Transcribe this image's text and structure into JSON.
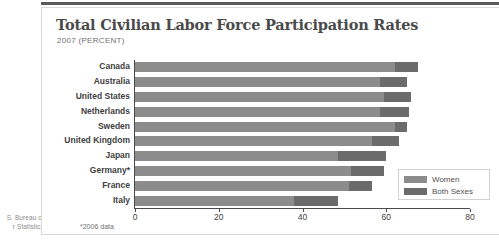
{
  "page": {
    "source_margin_line1": "S. Bureau of",
    "source_margin_line2": "r Statistics"
  },
  "panel": {
    "title": "Total Civilian Labor Force Participation Rates",
    "subtitle": "2007 (PERCENT)",
    "footnote": "*2006 data"
  },
  "legend": {
    "position": "inside-bottom-right",
    "items": [
      {
        "label": "Women",
        "color": "#8c8c8c"
      },
      {
        "label": "Both Sexes",
        "color": "#6b6b6b"
      }
    ]
  },
  "colors": {
    "women": "#8c8c8c",
    "both_sexes": "#6b6b6b",
    "axis": "#4a4a4a",
    "title": "#4a4a4a",
    "panel_border": "#d9d9d9"
  },
  "chart_data": {
    "type": "bar",
    "orientation": "horizontal",
    "title": "Total Civilian Labor Force Participation Rates",
    "subtitle": "2007 (PERCENT)",
    "xlabel": "",
    "ylabel": "",
    "xlim": [
      0,
      80
    ],
    "xticks": [
      0,
      20,
      40,
      60,
      80
    ],
    "grid": false,
    "legend": [
      "Women",
      "Both Sexes"
    ],
    "categories": [
      "Canada",
      "Australia",
      "United States",
      "Netherlands",
      "Sweden",
      "United Kingdom",
      "Japan",
      "Germany*",
      "France",
      "Italy"
    ],
    "series": [
      {
        "name": "Women",
        "color": "#8c8c8c",
        "values": [
          62.0,
          58.5,
          59.5,
          58.5,
          62.0,
          56.5,
          48.5,
          51.5,
          51.0,
          38.0
        ]
      },
      {
        "name": "Both Sexes",
        "color": "#6b6b6b",
        "values": [
          67.5,
          65.0,
          66.0,
          65.5,
          65.0,
          63.0,
          60.0,
          59.5,
          56.5,
          48.5
        ]
      }
    ],
    "notes": "*2006 data"
  }
}
